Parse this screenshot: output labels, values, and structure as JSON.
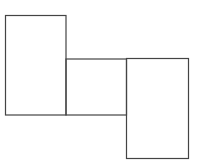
{
  "diagram": {
    "stroke": "#444444",
    "background": "#ffffff",
    "shapes": [
      {
        "id": "rect-left",
        "x": 5.5,
        "y": 15.5,
        "w": 60.5,
        "h": 99.5
      },
      {
        "id": "rect-middle",
        "x": 66,
        "y": 59,
        "w": 60.5,
        "h": 56
      },
      {
        "id": "rect-right",
        "x": 126.5,
        "y": 58.5,
        "w": 62,
        "h": 100
      }
    ]
  }
}
